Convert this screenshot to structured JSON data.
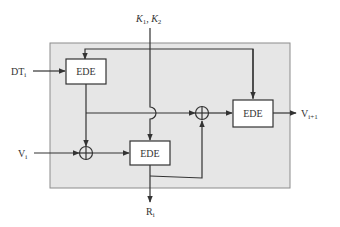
{
  "diagram": {
    "type": "block-diagram",
    "colors": {
      "background": "#ffffff",
      "panel_fill": "#e6e6e6",
      "panel_stroke": "#8c8c8c",
      "line": "#333333",
      "box_fill": "#ffffff"
    },
    "blocks": [
      {
        "id": "ede1",
        "label": "EDE"
      },
      {
        "id": "ede2",
        "label": "EDE"
      },
      {
        "id": "ede3",
        "label": "EDE"
      }
    ],
    "xor_nodes": [
      {
        "id": "xor1",
        "symbol": "⊕"
      },
      {
        "id": "xor2",
        "symbol": "⊕"
      }
    ],
    "inputs": {
      "keys": {
        "base": "K",
        "sub1": "1",
        "sep": ", ",
        "base2": "K",
        "sub2": "2"
      },
      "dt": {
        "base": "DT",
        "sub": "i"
      },
      "v": {
        "base": "V",
        "sub": "i"
      }
    },
    "outputs": {
      "v_next": {
        "base": "V",
        "sub": "i+1"
      },
      "r": {
        "base": "R",
        "sub": "i"
      }
    }
  }
}
